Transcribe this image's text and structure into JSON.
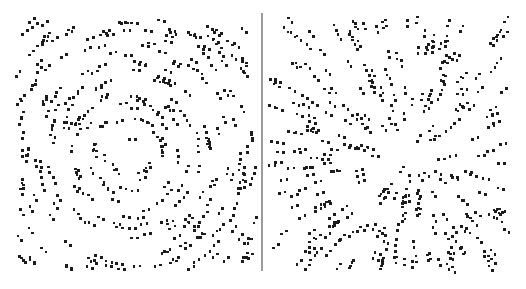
{
  "figure": {
    "caption": "",
    "width": 526,
    "height": 289,
    "background_color": "#ffffff",
    "dot_color": "#1c1c1c",
    "divider_color": "#4a4a4a"
  },
  "divider": {
    "name": "panel-divider",
    "x": 262,
    "y_top": 13,
    "y_bottom": 271,
    "stroke_width": 1.1
  },
  "panels": [
    {
      "id": "left",
      "label": "concentric",
      "pattern_type": "concentric",
      "description": "Concentric (circular) Glass pattern: dot pairs oriented tangentially around the centre.",
      "bounds": {
        "x": 18,
        "y": 19,
        "width": 238,
        "height": 252
      },
      "center": {
        "x": 133,
        "y": 155
      },
      "dot_radius": 1.35,
      "pair_separation": 6.0,
      "num_pairs": 300,
      "seed": 20250114
    },
    {
      "id": "right",
      "label": "radial",
      "pattern_type": "radial",
      "description": "Radial Glass pattern: dot pairs oriented along rays emanating from the centre.",
      "bounds": {
        "x": 270,
        "y": 19,
        "width": 238,
        "height": 252
      },
      "center": {
        "x": 408,
        "y": 160
      },
      "dot_radius": 1.35,
      "pair_separation": 6.0,
      "num_pairs": 300,
      "seed": 77345
    }
  ],
  "chart_data": {
    "type": "scatter",
    "xlabel": "",
    "ylabel": "",
    "grid": false,
    "legend": "none",
    "xlim": [
      0,
      526
    ],
    "ylim": [
      0,
      289
    ],
    "series": [
      {
        "name": "concentric",
        "pattern": "concentric",
        "center": [
          133,
          155
        ],
        "n_points": 600,
        "n_pairs": 300,
        "pair_separation_px": 6.0,
        "marker": "square",
        "marker_size_px": 2.7,
        "color": "#1c1c1c"
      },
      {
        "name": "radial",
        "pattern": "radial",
        "center": [
          408,
          160
        ],
        "n_points": 600,
        "n_pairs": 300,
        "pair_separation_px": 6.0,
        "marker": "square",
        "marker_size_px": 2.7,
        "color": "#1c1c1c"
      }
    ]
  }
}
